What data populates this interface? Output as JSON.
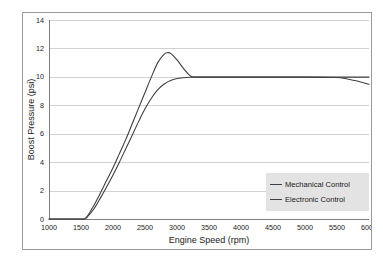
{
  "chart_data": {
    "type": "line",
    "title": "",
    "xlabel": "Engine Speed (rpm)",
    "ylabel": "Boost Pressure (psi)",
    "xlim": [
      1000,
      6000
    ],
    "ylim": [
      0,
      14
    ],
    "grid": "horizontal",
    "legend_position": "bottom-right",
    "xticks": [
      1000,
      1500,
      2000,
      2500,
      3000,
      3500,
      4000,
      4500,
      5000,
      5500,
      6000
    ],
    "yticks": [
      0,
      2,
      4,
      6,
      8,
      10,
      12,
      14
    ],
    "xtick_labels": [
      "1000",
      "1500",
      "2000",
      "2500",
      "3000",
      "3500",
      "4000",
      "4500",
      "5000",
      "5500",
      "6000"
    ],
    "ytick_labels": [
      "0",
      "2",
      "4",
      "6",
      "8",
      "10",
      "12",
      "14"
    ],
    "series": [
      {
        "name": "Mechanical Control",
        "color": "#404040",
        "x": [
          1000,
          1200,
          1400,
          1500,
          1550,
          1600,
          1700,
          1800,
          1900,
          2000,
          2100,
          2200,
          2300,
          2400,
          2500,
          2600,
          2700,
          2800,
          2850,
          2900,
          3000,
          3100,
          3200,
          3250,
          3300,
          3400,
          3600,
          4000,
          4500,
          5000,
          5500,
          5600,
          5700,
          5800,
          5900,
          6000
        ],
        "y": [
          0,
          0,
          0,
          0,
          0,
          0.2,
          0.95,
          1.8,
          2.7,
          3.6,
          4.6,
          5.6,
          6.7,
          7.8,
          8.9,
          10.0,
          11.0,
          11.6,
          11.7,
          11.65,
          11.2,
          10.6,
          10.1,
          10.0,
          9.98,
          9.98,
          9.98,
          9.98,
          9.98,
          9.98,
          9.95,
          9.9,
          9.82,
          9.72,
          9.6,
          9.48
        ]
      },
      {
        "name": "Electronic Control",
        "color": "#404040",
        "x": [
          1000,
          1200,
          1400,
          1500,
          1550,
          1600,
          1700,
          1800,
          1900,
          2000,
          2100,
          2200,
          2300,
          2400,
          2500,
          2600,
          2700,
          2800,
          2900,
          3000,
          3100,
          3200,
          3300,
          3400,
          3600,
          4000,
          4500,
          5000,
          5500,
          6000
        ],
        "y": [
          0,
          0,
          0,
          0,
          0,
          0.15,
          0.7,
          1.45,
          2.25,
          3.1,
          4.0,
          4.95,
          5.9,
          6.85,
          7.75,
          8.5,
          9.1,
          9.5,
          9.75,
          9.88,
          9.94,
          9.97,
          9.98,
          9.98,
          9.98,
          9.98,
          9.98,
          9.98,
          9.98,
          9.98
        ]
      }
    ]
  },
  "legend": {
    "entries": [
      {
        "label": "Mechanical Control"
      },
      {
        "label": "Electronic Control"
      }
    ]
  }
}
